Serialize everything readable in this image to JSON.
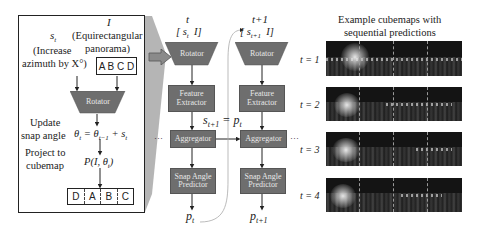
{
  "left_panel": {
    "s_label": "s",
    "s_sub": "t",
    "s_desc_line1": "(Increase",
    "s_desc_line2": "azimuth by X°)",
    "i_label": "I",
    "i_desc_line1": "(Equirectangular",
    "i_desc_line2": "panorama)",
    "input_faces": "A B C D",
    "rotator_label": "Rotator",
    "update_label_line1": "Update",
    "update_label_line2": "snap angle",
    "update_eq": "θt = θt−1 + st",
    "project_label_line1": "Project to",
    "project_label_line2": "cubemap",
    "project_eq": "P(I, θt)",
    "output_faces": [
      "D",
      "A",
      "B",
      "C"
    ]
  },
  "pipeline": {
    "columns": [
      {
        "time_label": "t",
        "input_label": "[ st  I]",
        "rotator": "Rotator",
        "feature_extractor_line1": "Feature",
        "feature_extractor_line2": "Extractor",
        "aggregator": "Aggregator",
        "predictor_line1": "Snap Angle",
        "predictor_line2": "Predictor",
        "output": "pt"
      },
      {
        "time_label": "t+1",
        "input_label": "[ st+1  I]",
        "rotator": "Rotator",
        "feature_extractor_line1": "Feature",
        "feature_extractor_line2": "Extractor",
        "aggregator": "Aggregator",
        "predictor_line1": "Snap Angle",
        "predictor_line2": "Predictor",
        "output": "pt+1"
      }
    ],
    "feedback_eq": "st+1 = pt",
    "ellipsis": "···"
  },
  "examples": {
    "title_line1": "Example cubemaps with",
    "title_line2": "sequential predictions",
    "rows": [
      {
        "label": "t = 1"
      },
      {
        "label": "t = 2"
      },
      {
        "label": "t = 3"
      },
      {
        "label": "t = 4"
      }
    ]
  },
  "colors": {
    "box_fill": "#6e6e6e",
    "box_text": "#e8e8e8",
    "wedge": "#9a9a9a",
    "strip_bg": "#141414"
  }
}
